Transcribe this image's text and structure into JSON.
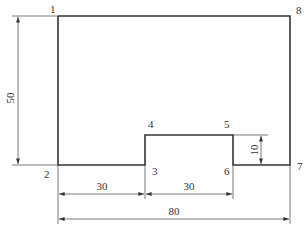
{
  "diagram": {
    "type": "polygon-with-dimensions",
    "vertices": [
      {
        "id": "1",
        "label": "1"
      },
      {
        "id": "2",
        "label": "2"
      },
      {
        "id": "3",
        "label": "3"
      },
      {
        "id": "4",
        "label": "4"
      },
      {
        "id": "5",
        "label": "5"
      },
      {
        "id": "6",
        "label": "6"
      },
      {
        "id": "7",
        "label": "7"
      },
      {
        "id": "8",
        "label": "8"
      }
    ],
    "dimensions": {
      "height_left": "50",
      "width_seg_2_3": "30",
      "width_seg_3_6": "30",
      "total_width": "80",
      "step_height": "10"
    },
    "colors": {
      "outline": "#333333",
      "dimension_lines": "#555555"
    }
  }
}
